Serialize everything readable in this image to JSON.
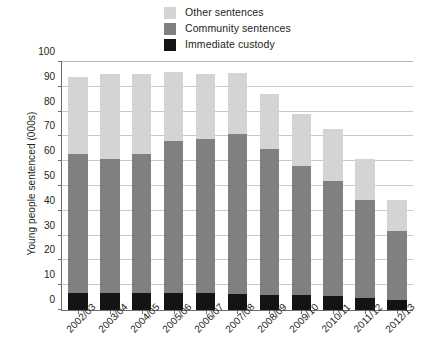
{
  "chart_data": {
    "type": "bar",
    "stacked": true,
    "title": "",
    "xlabel": "",
    "ylabel": "Young people sentenced (000s)",
    "ylim": [
      0,
      100
    ],
    "ytick_step": 10,
    "yticks": [
      100,
      90,
      80,
      70,
      60,
      50,
      40,
      30,
      20,
      10,
      0
    ],
    "grid": true,
    "legend_position": "top-center",
    "categories": [
      "2002/03",
      "2003/04",
      "2004/05",
      "2005/06",
      "2006/07",
      "2007/08",
      "2008/09",
      "2009/10",
      "2010/11",
      "2011/12",
      "2012/13"
    ],
    "series": [
      {
        "name": "Immediate custody",
        "color": "#141414",
        "values": [
          7,
          7,
          7,
          7,
          7,
          6.5,
          6,
          6,
          5.5,
          5,
          4
        ]
      },
      {
        "name": "Community sentences",
        "color": "#808080",
        "values": [
          56,
          54,
          56,
          61,
          62,
          64.5,
          59,
          52,
          46.5,
          39.5,
          28
        ]
      },
      {
        "name": "Other sentences",
        "color": "#d4d4d4",
        "values": [
          31,
          34,
          32,
          28,
          26,
          24.5,
          22,
          21,
          21,
          16.5,
          12.5
        ]
      }
    ],
    "totals": [
      94,
      95,
      95,
      96,
      95,
      95.5,
      87,
      79,
      73,
      61,
      44.5
    ],
    "colors": {
      "immediate_custody": "#141414",
      "community_sentences": "#808080",
      "other_sentences": "#d4d4d4",
      "axis": "#6e6e6e",
      "gridline": "#c9c9c9",
      "text": "#231f20",
      "background": "#ffffff"
    },
    "legend": [
      {
        "label": "Other sentences",
        "color": "#d4d4d4"
      },
      {
        "label": "Community sentences",
        "color": "#808080"
      },
      {
        "label": "Immediate custody",
        "color": "#141414"
      }
    ]
  }
}
